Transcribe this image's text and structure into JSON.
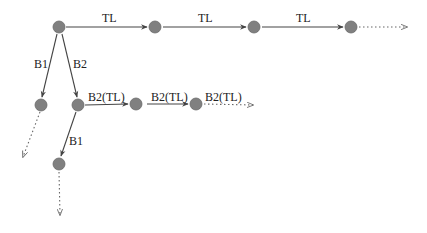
{
  "diagram": {
    "type": "branching-tree",
    "colors": {
      "node": "#808080",
      "edge": "#444444",
      "label": "#222222",
      "background": "#ffffff"
    },
    "nodes": [
      {
        "id": "n0",
        "x": 59,
        "y": 27
      },
      {
        "id": "n1",
        "x": 155,
        "y": 27
      },
      {
        "id": "n2",
        "x": 254,
        "y": 27
      },
      {
        "id": "n3",
        "x": 351,
        "y": 27
      },
      {
        "id": "n4",
        "x": 41,
        "y": 105
      },
      {
        "id": "n5",
        "x": 78,
        "y": 105
      },
      {
        "id": "n6",
        "x": 136,
        "y": 104
      },
      {
        "id": "n7",
        "x": 196,
        "y": 104
      },
      {
        "id": "n8",
        "x": 59,
        "y": 164
      }
    ],
    "edges": [
      {
        "from": "n0",
        "to": "n1",
        "label": "TL",
        "style": "solid"
      },
      {
        "from": "n1",
        "to": "n2",
        "label": "TL",
        "style": "solid"
      },
      {
        "from": "n2",
        "to": "n3",
        "label": "TL",
        "style": "solid"
      },
      {
        "from": "n3",
        "to": "out-right",
        "label": "",
        "style": "dotted"
      },
      {
        "from": "n0",
        "to": "n4",
        "label": "B1",
        "style": "solid"
      },
      {
        "from": "n0",
        "to": "n5",
        "label": "B2",
        "style": "solid"
      },
      {
        "from": "n5",
        "to": "n6",
        "label": "B2(TL)",
        "style": "solid"
      },
      {
        "from": "n6",
        "to": "n7",
        "label": "B2(TL)",
        "style": "solid"
      },
      {
        "from": "n7",
        "to": "out-right-2",
        "label": "B2(TL)",
        "style": "dotted"
      },
      {
        "from": "n4",
        "to": "out-down-left",
        "label": "",
        "style": "dotted"
      },
      {
        "from": "n5",
        "to": "n8",
        "label": "B1",
        "style": "solid"
      },
      {
        "from": "n8",
        "to": "out-down",
        "label": "",
        "style": "dotted"
      }
    ],
    "labels": {
      "tl_1": "TL",
      "tl_2": "TL",
      "tl_3": "TL",
      "b1_top": "B1",
      "b2_top": "B2",
      "b2tl_1": "B2(TL)",
      "b2tl_2": "B2(TL)",
      "b2tl_3": "B2(TL)",
      "b1_lower": "B1"
    }
  }
}
